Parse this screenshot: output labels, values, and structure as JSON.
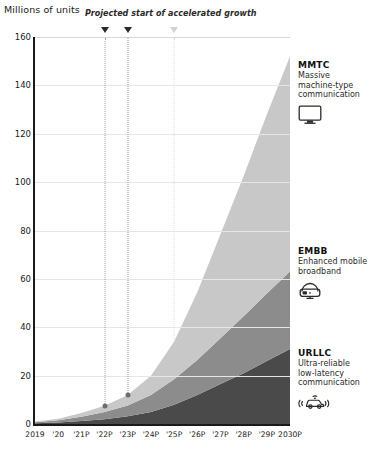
{
  "chart_data": {
    "type": "area",
    "stacked": true,
    "title": "",
    "ylabel": "Millions of units",
    "xlabel": "",
    "ylim": [
      0,
      160
    ],
    "ytick_step": 20,
    "yticks": [
      "0",
      "20",
      "40",
      "60",
      "80",
      "100",
      "120",
      "140",
      "160"
    ],
    "grid": true,
    "legend_position": "right",
    "categories": [
      "2019",
      "'20",
      "'21P",
      "'22P",
      "'23P",
      "'24P",
      "'25P",
      "'26P",
      "'27P",
      "'28P",
      "'29P",
      "2030P"
    ],
    "series": [
      {
        "name": "URLLC",
        "color": "#4a4a4a",
        "values": [
          0.3,
          0.6,
          1.2,
          2.0,
          3.2,
          5.0,
          8.0,
          12.0,
          16.5,
          21.0,
          26.0,
          31.0
        ]
      },
      {
        "name": "EMBB",
        "color": "#8c8c8c",
        "values": [
          0.4,
          0.9,
          1.8,
          3.0,
          4.5,
          7.0,
          10.5,
          14.5,
          19.0,
          23.5,
          28.0,
          32.0
        ]
      },
      {
        "name": "MMTC",
        "color": "#c8c8c8",
        "values": [
          0.3,
          0.7,
          1.5,
          2.5,
          4.3,
          8.0,
          15.5,
          28.0,
          43.0,
          58.0,
          74.0,
          89.0
        ]
      }
    ],
    "totals": [
      1.0,
      2.2,
      4.5,
      7.5,
      12.0,
      20.0,
      34.0,
      54.5,
      78.5,
      102.5,
      128.0,
      152.0
    ],
    "annotation": {
      "text": "Projected start of accelerated growth",
      "markers": [
        {
          "category": "'22P",
          "style": "dark"
        },
        {
          "category": "'23P",
          "style": "dark"
        },
        {
          "category": "'25P",
          "style": "light"
        }
      ]
    }
  },
  "axis": {
    "ylabel": "Millions of units"
  },
  "legend": [
    {
      "key": "mmtc",
      "title": "MMTC",
      "desc": "Massive machine-type communication",
      "icon": "monitor-icon",
      "color": "#c8c8c8"
    },
    {
      "key": "embb",
      "title": "EMBB",
      "desc": "Enhanced mobile broadband",
      "icon": "vr-headset-icon",
      "color": "#8c8c8c"
    },
    {
      "key": "urllc",
      "title": "URLLC",
      "desc": "Ultra-reliable low-latency communication",
      "icon": "connected-car-icon",
      "color": "#4a4a4a"
    }
  ]
}
